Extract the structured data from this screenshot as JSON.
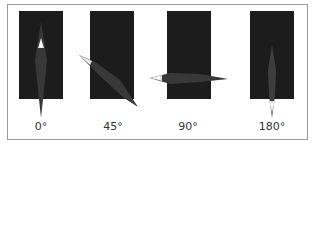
{
  "figure": {
    "panels": [
      {
        "label": "0°",
        "rotation_deg": 0
      },
      {
        "label": "45°",
        "rotation_deg": 45
      },
      {
        "label": "90°",
        "rotation_deg": 90
      },
      {
        "label": "180°",
        "rotation_deg": 180
      }
    ],
    "colors": {
      "panel_bg": "#1c1c1c",
      "shape_fill": "#3a3a3a",
      "highlight": "#f0f0f0",
      "border": "#9a9a9a"
    }
  }
}
